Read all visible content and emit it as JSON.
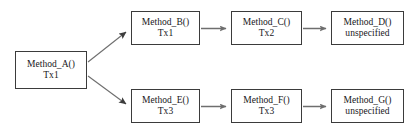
{
  "diagram": {
    "type": "flow-graph",
    "canvas": {
      "width": 416,
      "height": 134,
      "background": "#ffffff"
    },
    "style": {
      "node_border_color": "#3b3b3b",
      "node_fill_color": "#ffffff",
      "text_color": "#17171a",
      "edge_color": "#6e6e6e"
    },
    "nodes": [
      {
        "id": "A",
        "title": "Method_A()",
        "subtitle": "Tx1",
        "x": 15,
        "y": 51,
        "width": 72,
        "height": 38
      },
      {
        "id": "B",
        "title": "Method_B()",
        "subtitle": "Tx1",
        "x": 131,
        "y": 11,
        "width": 69,
        "height": 34
      },
      {
        "id": "C",
        "title": "Method_C()",
        "subtitle": "Tx2",
        "x": 231,
        "y": 11,
        "width": 71,
        "height": 34
      },
      {
        "id": "D",
        "title": "Method_D()",
        "subtitle": "unspecified",
        "x": 331,
        "y": 11,
        "width": 73,
        "height": 34
      },
      {
        "id": "E",
        "title": "Method_E()",
        "subtitle": "Tx3",
        "x": 131,
        "y": 89,
        "width": 69,
        "height": 34
      },
      {
        "id": "F",
        "title": "Method_F()",
        "subtitle": "Tx3",
        "x": 231,
        "y": 89,
        "width": 71,
        "height": 34
      },
      {
        "id": "G",
        "title": "Method_G()",
        "subtitle": "unspecified",
        "x": 331,
        "y": 89,
        "width": 73,
        "height": 34
      }
    ],
    "edges": [
      {
        "id": "A-B",
        "from": "A",
        "to": "B",
        "kind": "diagonal-up"
      },
      {
        "id": "A-E",
        "from": "A",
        "to": "E",
        "kind": "diagonal-down"
      },
      {
        "id": "B-C",
        "from": "B",
        "to": "C",
        "kind": "horizontal"
      },
      {
        "id": "C-D",
        "from": "C",
        "to": "D",
        "kind": "horizontal"
      },
      {
        "id": "E-F",
        "from": "E",
        "to": "F",
        "kind": "horizontal"
      },
      {
        "id": "F-G",
        "from": "F",
        "to": "G",
        "kind": "horizontal"
      }
    ]
  }
}
